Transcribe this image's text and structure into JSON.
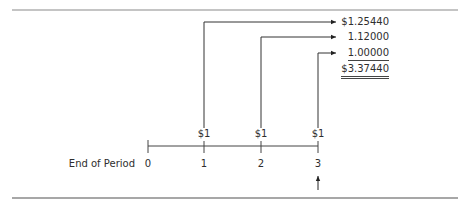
{
  "diagram": {
    "timeline_label": "End of Period",
    "periods": [
      "0",
      "1",
      "2",
      "3"
    ],
    "cash_flows": [
      {
        "period": "1",
        "label": "$1"
      },
      {
        "period": "2",
        "label": "$1"
      },
      {
        "period": "3",
        "label": "$1"
      }
    ],
    "future_values": [
      {
        "from_period": "1",
        "value": "$1.25440"
      },
      {
        "from_period": "2",
        "value": "1.12000"
      },
      {
        "from_period": "3",
        "value": "1.00000"
      }
    ],
    "total": "$3.37440",
    "evaluation_point_marker": "arrow under period 3",
    "colors": {
      "line": "#333333",
      "rule": "#8a8a8a",
      "text": "#2e2e2e"
    }
  }
}
